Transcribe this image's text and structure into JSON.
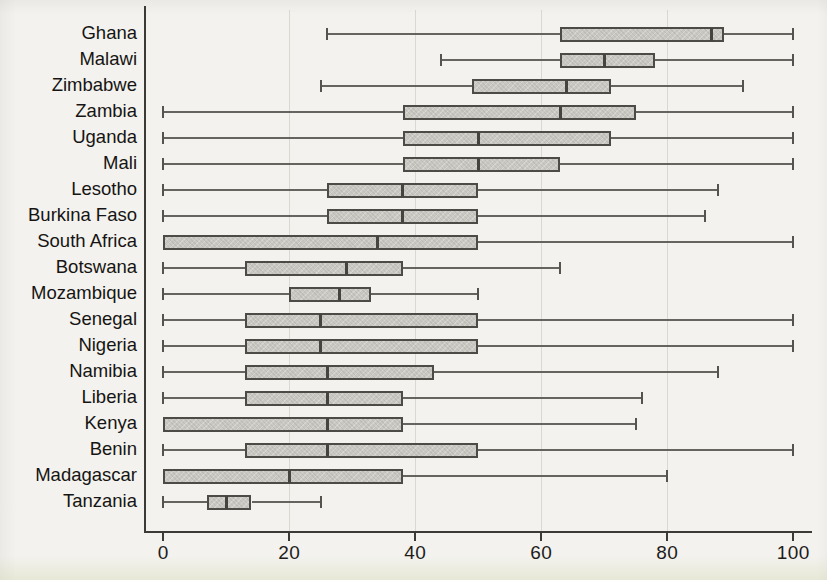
{
  "chart_data": {
    "type": "boxplot",
    "orientation": "horizontal",
    "title": "",
    "xlabel": "",
    "ylabel": "",
    "x_ticks": [
      "0",
      "20",
      "40",
      "60",
      "80",
      "100"
    ],
    "x_tick_values": [
      0,
      20,
      40,
      60,
      80,
      100
    ],
    "xlim": [
      0,
      103
    ],
    "grid": "faint vertical lines at 20/40/60/80",
    "legend": "none",
    "categories": [
      "Ghana",
      "Malawi",
      "Zimbabwe",
      "Zambia",
      "Uganda",
      "Mali",
      "Lesotho",
      "Burkina Faso",
      "South Africa",
      "Botswana",
      "Mozambique",
      "Senegal",
      "Nigeria",
      "Namibia",
      "Liberia",
      "Kenya",
      "Benin",
      "Madagascar",
      "Tanzania"
    ],
    "boxes": [
      {
        "label": "Ghana",
        "min": 26,
        "q1": 63,
        "median": 87,
        "q3": 89,
        "max": 100
      },
      {
        "label": "Malawi",
        "min": 44,
        "q1": 63,
        "median": 70,
        "q3": 78,
        "max": 100
      },
      {
        "label": "Zimbabwe",
        "min": 25,
        "q1": 49,
        "median": 64,
        "q3": 71,
        "max": 92
      },
      {
        "label": "Zambia",
        "min": 0,
        "q1": 38,
        "median": 63,
        "q3": 75,
        "max": 100
      },
      {
        "label": "Uganda",
        "min": 0,
        "q1": 38,
        "median": 50,
        "q3": 71,
        "max": 100
      },
      {
        "label": "Mali",
        "min": 0,
        "q1": 38,
        "median": 50,
        "q3": 63,
        "max": 100
      },
      {
        "label": "Lesotho",
        "min": 0,
        "q1": 26,
        "median": 38,
        "q3": 50,
        "max": 88
      },
      {
        "label": "Burkina Faso",
        "min": 0,
        "q1": 26,
        "median": 38,
        "q3": 50,
        "max": 86
      },
      {
        "label": "South Africa",
        "min": 0,
        "q1": 0,
        "median": 34,
        "q3": 50,
        "max": 100
      },
      {
        "label": "Botswana",
        "min": 0,
        "q1": 13,
        "median": 29,
        "q3": 38,
        "max": 63
      },
      {
        "label": "Mozambique",
        "min": 0,
        "q1": 20,
        "median": 28,
        "q3": 33,
        "max": 50
      },
      {
        "label": "Senegal",
        "min": 0,
        "q1": 13,
        "median": 25,
        "q3": 50,
        "max": 100
      },
      {
        "label": "Nigeria",
        "min": 0,
        "q1": 13,
        "median": 25,
        "q3": 50,
        "max": 100
      },
      {
        "label": "Namibia",
        "min": 0,
        "q1": 13,
        "median": 26,
        "q3": 43,
        "max": 88
      },
      {
        "label": "Liberia",
        "min": 0,
        "q1": 13,
        "median": 26,
        "q3": 38,
        "max": 76
      },
      {
        "label": "Kenya",
        "min": 0,
        "q1": 0,
        "median": 26,
        "q3": 38,
        "max": 75
      },
      {
        "label": "Benin",
        "min": 0,
        "q1": 13,
        "median": 26,
        "q3": 50,
        "max": 100
      },
      {
        "label": "Madagascar",
        "min": 0,
        "q1": 0,
        "median": 20,
        "q3": 38,
        "max": 80
      },
      {
        "label": "Tanzania",
        "min": 0,
        "q1": 7,
        "median": 10,
        "q3": 14,
        "max": 25
      }
    ]
  },
  "colors": {
    "background": "#f3f2ee",
    "box_fill": "#c9c8c2",
    "box_border": "#4c4b46",
    "axis": "#3b3a37",
    "text": "#1d1c1a"
  }
}
